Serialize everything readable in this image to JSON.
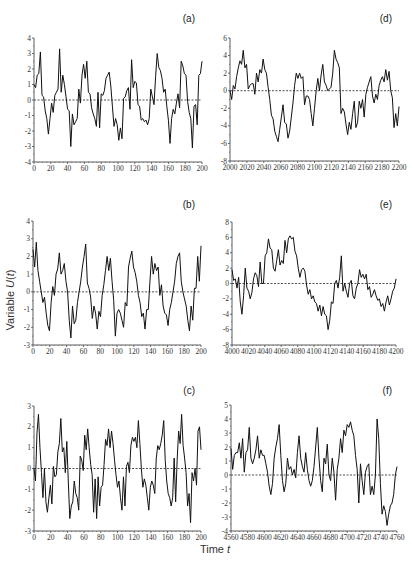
{
  "figure": {
    "ylabel": "Variable U(t)",
    "xlabel": "Time t"
  },
  "chart_data": [
    {
      "type": "line",
      "panel": "(a)",
      "x_start": 0,
      "x_end": 200,
      "x_ticks": [
        0,
        20,
        40,
        60,
        80,
        100,
        120,
        140,
        160,
        180,
        200
      ],
      "ylim": [
        -4,
        4
      ],
      "y_ticks": [
        -4,
        -3,
        -2,
        -1,
        0,
        1,
        2,
        3,
        4
      ],
      "reference_line": 0,
      "values": [
        1.0,
        0.8,
        1.6,
        1.7,
        3.1,
        0.3,
        0.2,
        -0.7,
        -1.2,
        -2.2,
        -1.2,
        -0.2,
        -0.8,
        0.3,
        0.5,
        0.7,
        3.3,
        0.5,
        1.6,
        1.0,
        0.2,
        -0.6,
        -0.7,
        -3.0,
        -0.9,
        -1.6,
        -1.4,
        -1.2,
        0.7,
        -0.2,
        1.6,
        2.3,
        1.4,
        2.5,
        0.5,
        0.4,
        -0.5,
        -0.9,
        -1.2,
        -1.7,
        0.5,
        -1.8,
        0.4,
        0.3,
        0.6,
        1.4,
        1.6,
        1.8,
        0.9,
        -0.4,
        -1.7,
        -1.2,
        -1.6,
        -2.6,
        -1.8,
        -2.5,
        0.1,
        0.2,
        0.6,
        0.8,
        -0.6,
        2.6,
        0.8,
        1.2,
        1.1,
        -0.3,
        -0.4,
        -1.3,
        -1.2,
        -1.4,
        -1.3,
        -1.6,
        -1.2,
        0.7,
        0.2,
        -0.3,
        1.5,
        3.0,
        2.1,
        1.9,
        1.4,
        0.5,
        0.7,
        -0.4,
        -1.3,
        -2.8,
        -1.2,
        -0.6,
        -0.9,
        -0.2,
        0.4,
        -0.5,
        2.5,
        2.2,
        1.7,
        1.6,
        -0.1,
        -0.8,
        -1.2,
        -3.1,
        -0.4,
        -0.3,
        -1.6,
        1.6,
        1.7,
        2.5
      ],
      "title": "",
      "grid": false
    },
    {
      "type": "line",
      "panel": "(b)",
      "x_start": 0,
      "x_end": 200,
      "x_ticks": [
        0,
        20,
        40,
        60,
        80,
        100,
        120,
        140,
        160,
        180,
        200
      ],
      "ylim": [
        -3,
        4
      ],
      "y_ticks": [
        -3,
        -2,
        -1,
        0,
        1,
        2,
        3,
        4
      ],
      "reference_line": 0,
      "values": [
        2.4,
        1.4,
        2.8,
        1.2,
        0.6,
        0.0,
        -0.6,
        -0.3,
        -1.2,
        -1.9,
        -2.2,
        -0.6,
        0.3,
        -0.2,
        1.0,
        1.3,
        2.2,
        1.0,
        1.2,
        1.6,
        0.6,
        0.0,
        -1.6,
        -2.6,
        -0.8,
        -1.8,
        -1.6,
        -0.6,
        0.0,
        0.6,
        1.4,
        2.0,
        2.7,
        0.5,
        0.2,
        -0.3,
        -1.5,
        -0.8,
        -1.2,
        -2.1,
        -1.1,
        -1.4,
        -0.2,
        0.4,
        1.2,
        2.0,
        1.2,
        1.9,
        0.6,
        -0.5,
        -2.5,
        -1.2,
        -1.0,
        -1.2,
        -1.6,
        -2.0,
        -0.6,
        -0.8,
        1.4,
        1.9,
        2.3,
        1.4,
        1.1,
        0.6,
        -0.2,
        -0.6,
        -1.4,
        -1.2,
        -2.1,
        -1.0,
        -1.0,
        0.6,
        2.0,
        1.0,
        1.6,
        1.2,
        1.4,
        -0.2,
        0.4,
        -0.8,
        -1.2,
        -1.3,
        -1.9,
        -1.0,
        -0.6,
        0.0,
        0.6,
        1.6,
        2.0,
        2.2,
        0.6,
        0.0,
        -0.4,
        -0.8,
        -1.6,
        -2.2,
        -0.8,
        -1.6,
        0.2,
        0.2,
        2.0,
        0.6,
        2.6
      ],
      "title": "",
      "grid": false
    },
    {
      "type": "line",
      "panel": "(c)",
      "x_start": 0,
      "x_end": 200,
      "x_ticks": [
        0,
        20,
        40,
        60,
        80,
        100,
        120,
        140,
        160,
        180,
        200
      ],
      "ylim": [
        -3,
        3
      ],
      "y_ticks": [
        -3,
        -2,
        -1,
        0,
        1,
        2,
        3
      ],
      "reference_line": 0,
      "values": [
        0.0,
        -0.6,
        1.7,
        2.6,
        1.0,
        -0.2,
        -1.4,
        0.0,
        -1.6,
        -2.1,
        -1.4,
        -0.8,
        -1.7,
        0.1,
        -0.4,
        -0.3,
        0.8,
        1.2,
        2.4,
        0.8,
        1.0,
        -0.2,
        1.3,
        -0.6,
        -2.4,
        -1.8,
        -1.6,
        -0.6,
        -1.2,
        -1.4,
        -2.0,
        0.6,
        0.4,
        -0.1,
        1.6,
        0.9,
        1.9,
        1.0,
        0.2,
        -0.3,
        -2.1,
        -0.5,
        -2.4,
        -0.4,
        -1.8,
        -0.9,
        -0.8,
        0.2,
        1.4,
        1.1,
        1.9,
        1.0,
        1.8,
        1.2,
        0.4,
        -0.3,
        -0.9,
        -0.6,
        -1.4,
        -2.0,
        -0.4,
        -1.8,
        0.1,
        0.3,
        -0.2,
        1.1,
        1.5,
        1.3,
        1.5,
        1.0,
        2.3,
        1.2,
        0.0,
        -0.9,
        -0.5,
        -0.8,
        -1.4,
        -2.0,
        -0.9,
        -0.6,
        -0.8,
        -1.2,
        0.5,
        1.1,
        0.9,
        1.2,
        1.6,
        2.3,
        0.4,
        -0.6,
        -1.2,
        -1.4,
        -1.8,
        -1.4,
        0.5,
        -1.6,
        0.4,
        1.8,
        1.2,
        2.6,
        1.1,
        0.5,
        -0.2,
        -1.8,
        -1.2,
        -2.6,
        -0.2,
        -0.6,
        0.0,
        -0.8,
        1.8,
        2.0,
        0.9
      ],
      "title": "",
      "grid": false
    },
    {
      "type": "line",
      "panel": "(d)",
      "x_start": 2000,
      "x_end": 2200,
      "x_ticks": [
        2000,
        2020,
        2040,
        2060,
        2080,
        2100,
        2120,
        2140,
        2160,
        2180,
        2200
      ],
      "ylim": [
        -8,
        6
      ],
      "y_ticks": [
        -8,
        -6,
        -4,
        -2,
        0,
        2,
        4,
        6
      ],
      "reference_line": 0,
      "values": [
        0.0,
        -1.0,
        0.6,
        0.2,
        1.6,
        2.6,
        3.4,
        3.0,
        4.6,
        2.6,
        3.0,
        0.2,
        0.6,
        0.8,
        0.8,
        -0.4,
        2.0,
        1.0,
        2.4,
        2.0,
        3.6,
        2.4,
        2.0,
        0.4,
        -1.0,
        -2.8,
        -3.2,
        -4.6,
        -5.2,
        -5.8,
        -4.4,
        -3.0,
        -1.6,
        -3.6,
        -3.8,
        -5.4,
        -4.6,
        -3.0,
        -1.4,
        0.6,
        2.0,
        1.4,
        2.0,
        1.4,
        1.6,
        -1.6,
        -0.6,
        -0.6,
        -1.0,
        -2.6,
        -4.0,
        -2.0,
        0.0,
        1.4,
        0.0,
        1.8,
        3.0,
        1.0,
        0.6,
        0.0,
        0.2,
        0.4,
        2.0,
        4.6,
        3.6,
        3.2,
        2.6,
        -2.6,
        -2.0,
        -2.4,
        -3.8,
        -5.0,
        -3.6,
        -4.4,
        -2.6,
        -1.2,
        -4.2,
        -3.6,
        -1.2,
        -2.0,
        -1.0,
        -3.0,
        -0.4,
        0.4,
        1.0,
        1.6,
        -0.6,
        -1.4,
        -0.4,
        -1.0,
        0.6,
        1.2,
        1.6,
        1.0,
        2.4,
        1.2,
        2.2,
        0.0,
        -0.8,
        -4.2,
        -2.6,
        -4.0,
        -1.8
      ],
      "title": "",
      "grid": false
    },
    {
      "type": "line",
      "panel": "(e)",
      "x_start": 4000,
      "x_end": 4200,
      "x_ticks": [
        4000,
        4020,
        4040,
        4060,
        4080,
        4100,
        4120,
        4140,
        4160,
        4180,
        4200
      ],
      "ylim": [
        -8,
        8
      ],
      "y_ticks": [
        -8,
        -6,
        -4,
        -2,
        0,
        2,
        4,
        6,
        8
      ],
      "reference_line": 0,
      "values": [
        1.8,
        0.4,
        0.6,
        -0.6,
        0.8,
        -2.4,
        -4.0,
        -1.6,
        2.0,
        -0.6,
        -1.0,
        -2.0,
        -1.2,
        0.6,
        1.4,
        1.0,
        -0.4,
        2.8,
        0.0,
        0.0,
        3.6,
        4.0,
        5.8,
        4.6,
        4.4,
        2.0,
        1.6,
        3.0,
        4.4,
        2.4,
        3.0,
        2.6,
        5.6,
        4.0,
        5.8,
        6.2,
        5.8,
        6.0,
        4.2,
        3.6,
        2.0,
        0.8,
        1.8,
        2.0,
        1.6,
        -0.2,
        -1.4,
        -0.8,
        -2.0,
        -1.6,
        -2.4,
        -2.6,
        -3.6,
        -2.8,
        -4.2,
        -3.0,
        -4.0,
        -4.2,
        -6.0,
        -4.8,
        -2.4,
        -2.6,
        0.0,
        0.4,
        -0.6,
        0.8,
        3.6,
        -1.0,
        0.0,
        -1.0,
        -1.8,
        0.0,
        0.4,
        -1.6,
        -2.0,
        -0.6,
        0.0,
        1.8,
        0.8,
        1.2,
        0.6,
        1.2,
        -0.8,
        -0.4,
        -1.8,
        -1.4,
        -0.8,
        -1.6,
        -2.2,
        -2.0,
        -3.0,
        -2.6,
        -3.6,
        -2.4,
        -1.6,
        -2.8,
        -2.0,
        -1.0,
        -0.6,
        0.6
      ],
      "title": "",
      "grid": false
    },
    {
      "type": "line",
      "panel": "(f)",
      "x_start": 4560,
      "x_end": 4760,
      "x_ticks": [
        4560,
        4580,
        4600,
        4620,
        4640,
        4660,
        4680,
        4700,
        4720,
        4740,
        4760
      ],
      "ylim": [
        -4,
        5
      ],
      "y_ticks": [
        -4,
        -3,
        -2,
        -1,
        0,
        1,
        2,
        3,
        4,
        5
      ],
      "reference_line": 0,
      "values": [
        1.9,
        0.4,
        1.4,
        1.6,
        1.6,
        2.3,
        1.2,
        2.6,
        0.2,
        1.6,
        1.8,
        3.4,
        1.2,
        0.8,
        1.2,
        1.8,
        2.8,
        1.2,
        1.8,
        1.4,
        1.4,
        0.8,
        0.2,
        -0.8,
        -1.4,
        -0.6,
        1.2,
        2.0,
        2.6,
        3.6,
        1.4,
        -0.4,
        -1.2,
        -0.6,
        1.2,
        0.4,
        0.6,
        0.0,
        0.4,
        -0.2,
        1.6,
        2.8,
        1.2,
        0.6,
        0.2,
        1.6,
        0.4,
        -0.4,
        -0.8,
        -0.4,
        0.6,
        2.0,
        3.4,
        1.2,
        -0.4,
        -1.2,
        1.2,
        0.8,
        2.2,
        0.0,
        -0.4,
        1.2,
        0.2,
        -1.8,
        0.4,
        1.2,
        2.6,
        1.6,
        3.2,
        2.8,
        3.6,
        3.4,
        3.8,
        3.2,
        2.8,
        1.4,
        0.4,
        -2.0,
        0.8,
        -0.4,
        -1.4,
        0.2,
        0.6,
        0.8,
        -1.4,
        -0.8,
        -1.4,
        0.0,
        4.0,
        2.6,
        -0.6,
        -2.8,
        -2.2,
        -2.6,
        -3.6,
        -2.8,
        -2.2,
        -2.0,
        -1.4,
        0.0,
        0.6
      ],
      "title": "",
      "grid": false
    }
  ]
}
